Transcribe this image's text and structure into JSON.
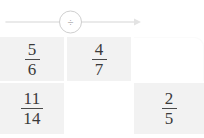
{
  "operator": {
    "symbol": "÷",
    "symbol_name": "division-sign",
    "arrow_direction": "right",
    "line_color": "#e3e3e3",
    "circle_color": "#bfbfbf",
    "symbol_color": "#8d8d8d"
  },
  "grid": {
    "columns": 3,
    "rows": 2,
    "cell_fill_color": "#f2f2f2",
    "empty_fill_color": "#ffffff",
    "text_color": "#3a3a3a",
    "cells": [
      {
        "id": "cell-r1c1",
        "state": "filled",
        "numerator": "5",
        "denominator": "6"
      },
      {
        "id": "cell-r1c2",
        "state": "filled",
        "numerator": "4",
        "denominator": "7"
      },
      {
        "id": "cell-r1c3",
        "state": "empty",
        "numerator": "",
        "denominator": ""
      },
      {
        "id": "cell-r2c1",
        "state": "filled",
        "numerator": "11",
        "denominator": "14"
      },
      {
        "id": "cell-r2c2",
        "state": "empty",
        "numerator": "",
        "denominator": ""
      },
      {
        "id": "cell-r2c3",
        "state": "filled",
        "numerator": "2",
        "denominator": "5"
      }
    ]
  }
}
